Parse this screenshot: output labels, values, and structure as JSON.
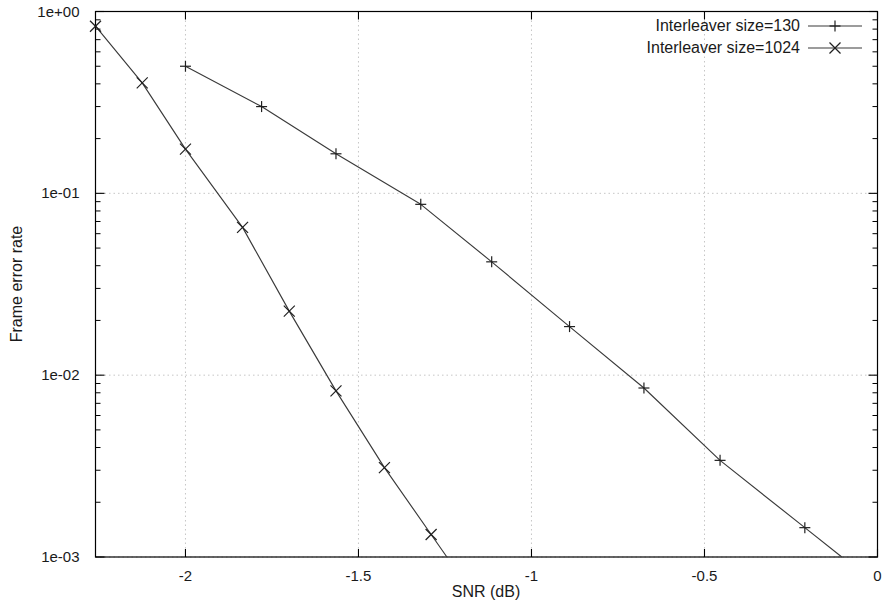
{
  "chart_data": {
    "type": "line",
    "title": "",
    "xlabel": "SNR (dB)",
    "ylabel": "Frame error rate",
    "xlim": [
      -2.26,
      0
    ],
    "ylim": [
      0.001,
      1
    ],
    "yscale": "log",
    "xscale": "linear",
    "grid": true,
    "legend_position": "top-right",
    "xticks": [
      -2,
      -1.5,
      -1,
      -0.5,
      0
    ],
    "xtick_labels": [
      "-2",
      "-1.5",
      "-1",
      "-0.5",
      "0"
    ],
    "yticks": [
      1,
      0.1,
      0.01,
      0.001
    ],
    "ytick_labels": [
      "1e+00",
      "1e-01",
      "1e-02",
      "1e-03"
    ],
    "series": [
      {
        "name": "Interleaver size=130",
        "marker": "plus",
        "x": [
          -2.0,
          -1.78,
          -1.565,
          -1.32,
          -1.115,
          -0.89,
          -0.675,
          -0.455,
          -0.21
        ],
        "y": [
          0.5,
          0.3,
          0.165,
          0.087,
          0.042,
          0.0185,
          0.0085,
          0.0034,
          0.00145
        ]
      },
      {
        "name": "Interleaver size=1024",
        "marker": "cross",
        "x": [
          -2.26,
          -2.125,
          -2.0,
          -1.835,
          -1.7,
          -1.565,
          -1.425,
          -1.29
        ],
        "y": [
          0.83,
          0.405,
          0.175,
          0.065,
          0.0225,
          0.0082,
          0.0031,
          0.00133
        ]
      }
    ]
  },
  "axis": {
    "x_title": "SNR (dB)",
    "y_title": "Frame error rate",
    "x_tick_labels": [
      "-2",
      "-1.5",
      "-1",
      "-0.5",
      "0"
    ],
    "y_tick_labels": [
      "1e+00",
      "1e-01",
      "1e-02",
      "1e-03"
    ]
  },
  "legend": {
    "entries": [
      {
        "label": "Interleaver size=130",
        "marker": "plus"
      },
      {
        "label": "Interleaver size=1024",
        "marker": "cross"
      }
    ]
  },
  "colors": {
    "axis": "#000000",
    "grid": "#bfbfbf",
    "series": "#3a3a3a",
    "background": "#ffffff",
    "text": "#1a1a1a"
  }
}
